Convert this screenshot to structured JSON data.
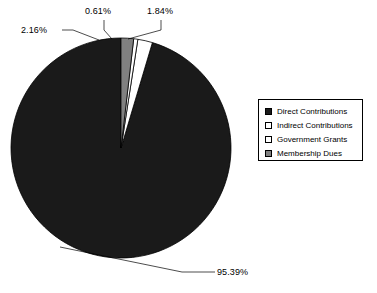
{
  "chart_data": {
    "type": "pie",
    "title": "",
    "categories": [
      "Direct Contributions",
      "Indirect Contributions",
      "Government Grants",
      "Membership Dues"
    ],
    "values": [
      95.39,
      2.16,
      0.61,
      1.84
    ],
    "value_labels": [
      "95.39%",
      "2.16%",
      "0.61%",
      "1.84%"
    ],
    "units": "percent",
    "legend_position": "right",
    "grid": false,
    "start_angle_deg": -90,
    "direction": "counterclockwise",
    "colors": [
      "#1a1a1a",
      "#ffffff",
      "#ffffff",
      "#808080"
    ],
    "slice_border_color": "#000000",
    "background": "#ffffff"
  },
  "labels": {
    "direct": "95.39%",
    "indirect": "2.16%",
    "government": "0.61%",
    "membership": "1.84%"
  },
  "legend": {
    "items": [
      {
        "label": "Direct Contributions",
        "color": "#1a1a1a",
        "swatch": "legend-swatch-filled-black"
      },
      {
        "label": "Indirect Contributions",
        "color": "#ffffff",
        "swatch": "legend-swatch-white"
      },
      {
        "label": "Government Grants",
        "color": "#ffffff",
        "swatch": "legend-swatch-white"
      },
      {
        "label": "Membership Dues",
        "color": "#808080",
        "swatch": "legend-swatch-gray"
      }
    ]
  }
}
